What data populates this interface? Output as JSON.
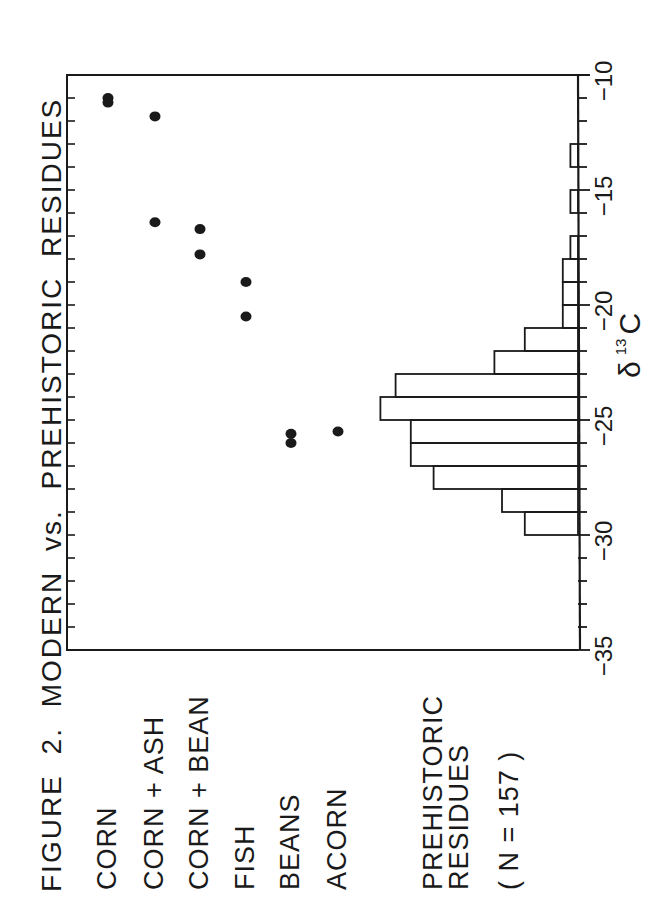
{
  "figure": {
    "title": "FIGURE  2.  MODERN  vs.  PREHISTORIC  RESIDUES",
    "categories": [
      {
        "label": "CORN",
        "row": 108
      },
      {
        "label": "CORN  +  ASH",
        "row": 155
      },
      {
        "label": "CORN  +  BEAN",
        "row": 200
      },
      {
        "label": "FISH",
        "row": 246
      },
      {
        "label": "BEANS",
        "row": 291
      },
      {
        "label": "ACORN",
        "row": 338
      }
    ],
    "histogram_label_line1": "PREHISTORIC",
    "histogram_label_line2": "RESIDUES",
    "n_label": "( N  =  157 )",
    "x_axis": {
      "symbol": "δ",
      "superscript": "13",
      "element": "C",
      "tick_labels": [
        "−35",
        "−30",
        "−25",
        "−20",
        "−15",
        "−10"
      ]
    }
  },
  "chart_data": {
    "type": "scatter+histogram",
    "title": "FIGURE 2. MODERN vs. PREHISTORIC RESIDUES",
    "xlabel": "δ13C",
    "xlim": [
      -35,
      -10
    ],
    "x_ticks": [
      -35,
      -30,
      -25,
      -20,
      -15,
      -10
    ],
    "minor_tick_step": 1,
    "orientation": "figure rotated 90° counter-clockwise on page",
    "series": [
      {
        "name": "CORN",
        "type": "scatter",
        "values": [
          -11.0,
          -11.2
        ]
      },
      {
        "name": "CORN + ASH",
        "type": "scatter",
        "values": [
          -11.8,
          -16.4
        ]
      },
      {
        "name": "CORN + BEAN",
        "type": "scatter",
        "values": [
          -16.7,
          -17.8
        ]
      },
      {
        "name": "FISH",
        "type": "scatter",
        "values": [
          -19.0,
          -20.5
        ]
      },
      {
        "name": "BEANS",
        "type": "scatter",
        "values": [
          -25.6,
          -26.0
        ]
      },
      {
        "name": "ACORN",
        "type": "scatter",
        "values": [
          -25.5
        ]
      },
      {
        "name": "PREHISTORIC RESIDUES (N = 157)",
        "type": "histogram",
        "bins": [
          {
            "from": -30,
            "to": -29,
            "count": 7
          },
          {
            "from": -29,
            "to": -28,
            "count": 10
          },
          {
            "from": -28,
            "to": -27,
            "count": 19
          },
          {
            "from": -27,
            "to": -26,
            "count": 22
          },
          {
            "from": -26,
            "to": -25,
            "count": 22
          },
          {
            "from": -25,
            "to": -24,
            "count": 26
          },
          {
            "from": -24,
            "to": -23,
            "count": 24
          },
          {
            "from": -23,
            "to": -22,
            "count": 11
          },
          {
            "from": -22,
            "to": -21,
            "count": 7
          },
          {
            "from": -21,
            "to": -20,
            "count": 2
          },
          {
            "from": -20,
            "to": -19,
            "count": 2
          },
          {
            "from": -19,
            "to": -18,
            "count": 2
          },
          {
            "from": -18,
            "to": -17,
            "count": 1
          },
          {
            "from": -16,
            "to": -15,
            "count": 1
          },
          {
            "from": -14,
            "to": -13,
            "count": 1
          }
        ]
      }
    ],
    "grid": false,
    "legend": "category labels listed at left of each row"
  }
}
